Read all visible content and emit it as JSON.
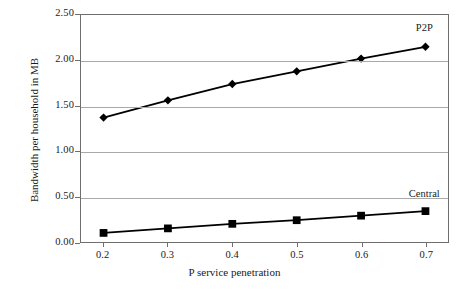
{
  "chart_data": {
    "type": "line",
    "title": "",
    "xlabel": "P service penetration",
    "ylabel": "Bandwidth per household in MB",
    "x": [
      0.2,
      0.3,
      0.4,
      0.5,
      0.6,
      0.7
    ],
    "xtick_labels": [
      "0.2",
      "0.3",
      "0.4",
      "0.5",
      "0.6",
      "0.7"
    ],
    "ytick_labels": [
      "0.00",
      "0.50",
      "1.00",
      "1.50",
      "2.00",
      "2.50"
    ],
    "yticks": [
      0.0,
      0.5,
      1.0,
      1.5,
      2.0,
      2.5
    ],
    "ylim": [
      0.0,
      2.5
    ],
    "xlim": [
      0.165,
      0.735
    ],
    "grid": "horizontal",
    "legend_position": "inline-annotation",
    "series": [
      {
        "name": "P2P",
        "marker": "diamond",
        "color": "#000000",
        "values": [
          1.37,
          1.56,
          1.74,
          1.88,
          2.02,
          2.15
        ],
        "annotation": "P2P"
      },
      {
        "name": "Central",
        "marker": "square",
        "color": "#000000",
        "values": [
          0.1,
          0.15,
          0.2,
          0.24,
          0.29,
          0.34
        ],
        "annotation": "Central"
      }
    ]
  },
  "colors": {
    "background": "#ffffff",
    "gridline": "#a9a9a9",
    "axis": "#6e6e6e",
    "text": "#1a1a1a",
    "line": "#000000"
  }
}
